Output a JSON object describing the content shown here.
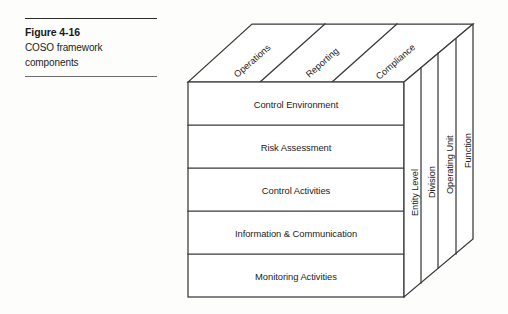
{
  "figure": {
    "caption_title": "Figure 4-16",
    "caption_line1": "COSO framework",
    "caption_line2": "components"
  },
  "diagram": {
    "type": "coso-cube",
    "top_face_labels": [
      "Operations",
      "Reporting",
      "Compliance"
    ],
    "front_face_rows": [
      "Control Environment",
      "Risk Assessment",
      "Control Activities",
      "Information & Communication",
      "Monitoring Activities"
    ],
    "side_face_labels": [
      "Entity Level",
      "Division",
      "Operating Unit",
      "Function"
    ],
    "colors": {
      "stroke": "#3a3a3a",
      "fill": "#ffffff",
      "text": "#1c1c1c",
      "background": "#fdfdfc"
    }
  }
}
